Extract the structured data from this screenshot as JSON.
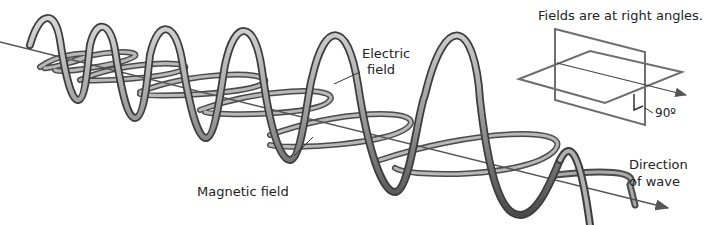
{
  "figure": {
    "inset": {
      "caption": "Fields are at right angles.",
      "angle_label": "90º"
    },
    "labels": {
      "electric_line1": "Electric",
      "electric_line2": "field",
      "magnetic": "Magnetic field",
      "direction_line1": "Direction",
      "direction_line2": "of wave"
    },
    "colors": {
      "ribbon_light": "#c8c8c8",
      "ribbon_dark": "#555555",
      "axis": "#555555",
      "inset_planes": "#6e6e6e",
      "text": "#222222"
    }
  }
}
